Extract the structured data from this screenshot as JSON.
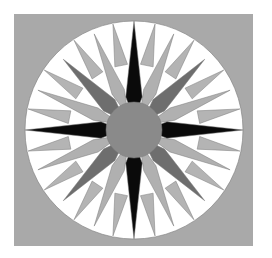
{
  "image": {
    "subject": "Mariner's Compass quilt block",
    "width": 272,
    "height": 258
  },
  "block": {
    "x": 14,
    "y": 14,
    "width": 239,
    "height": 232,
    "background_color": "#a9a9a9"
  },
  "compass": {
    "cx": 134,
    "cy": 130,
    "outer_radius": 109,
    "ring_inner_radius": 88,
    "center_radius": 28,
    "colors": {
      "ring_white": "#ffffff",
      "ring_tooth": "#b4b4b4",
      "cardinal_points": "#0a0a0a",
      "diagonal_points": "#6e6e6e",
      "secondary_points": "#b0b0b0",
      "center_circle": "#8a8a8a",
      "center_gaps": "#bdbdbd",
      "outline": "#7a7a7a"
    },
    "points": {
      "cardinal": {
        "count": 4,
        "offset_deg": 0,
        "tip_radius": 109,
        "half_width_deg": 14
      },
      "diagonal": {
        "count": 4,
        "offset_deg": 45,
        "tip_radius": 100,
        "half_width_deg": 13
      },
      "secondary": {
        "count": 8,
        "offset_deg": 22.5,
        "tip_radius": 104,
        "half_width_deg": 9
      },
      "tertiary": {
        "count": 16,
        "offset_deg": 11.25,
        "tip_radius": 108,
        "half_width_deg": 5.6
      }
    }
  }
}
